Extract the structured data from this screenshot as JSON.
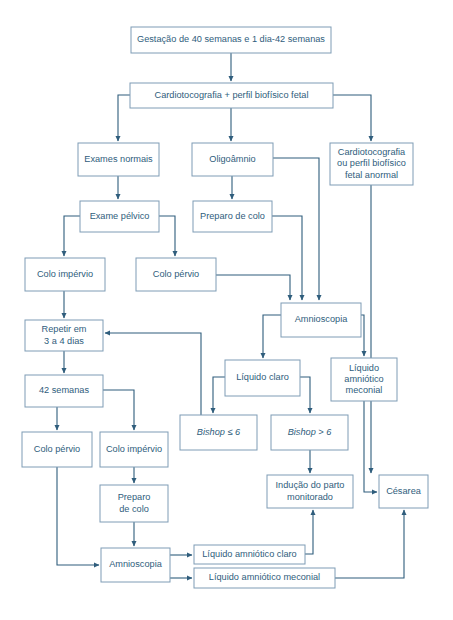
{
  "diagram": {
    "colors": {
      "box_stroke": "#7e9cb5",
      "box_fill": "#ffffff",
      "text": "#2f5d7c",
      "edge": "#2f5d7c",
      "background": "#ffffff"
    },
    "nodes": [
      {
        "id": "n1",
        "label": "Gestação de 40 semanas e 1 dia-42 semanas",
        "x": 131,
        "y": 27,
        "w": 200,
        "h": 26,
        "lines": [
          "Gestação de 40 semanas e 1 dia-42 semanas"
        ],
        "italic": false
      },
      {
        "id": "n2",
        "label": "Cardiotocografia + perfil biofísico fetal",
        "x": 130,
        "y": 83,
        "w": 203,
        "h": 25,
        "lines": [
          "Cardiotocografia + perfil biofísico fetal"
        ],
        "italic": false
      },
      {
        "id": "n3",
        "label": "Exames normais",
        "x": 78,
        "y": 143,
        "w": 81,
        "h": 33,
        "lines": [
          "Exames normais"
        ],
        "italic": false
      },
      {
        "id": "n4",
        "label": "Oligoâmnio",
        "x": 192,
        "y": 143,
        "w": 81,
        "h": 33,
        "lines": [
          "Oligoâmnio"
        ],
        "italic": false
      },
      {
        "id": "n5",
        "label": "Cardiotocografia ou perfil biofísico fetal anormal",
        "x": 330,
        "y": 143,
        "w": 83,
        "h": 42,
        "lines": [
          "Cardiotocografia",
          "ou perfil biofísico",
          "fetal anormal"
        ],
        "italic": false
      },
      {
        "id": "n6",
        "label": "Exame pélvico",
        "x": 80,
        "y": 201,
        "w": 79,
        "h": 31,
        "lines": [
          "Exame pélvico"
        ],
        "italic": false
      },
      {
        "id": "n7",
        "label": "Preparo de colo",
        "x": 193,
        "y": 201,
        "w": 79,
        "h": 31,
        "lines": [
          "Preparo de colo"
        ],
        "italic": false
      },
      {
        "id": "n8",
        "label": "Colo impérvio",
        "x": 25,
        "y": 258,
        "w": 80,
        "h": 33,
        "lines": [
          "Colo impérvio"
        ],
        "italic": false
      },
      {
        "id": "n9",
        "label": "Colo pérvio",
        "x": 136,
        "y": 258,
        "w": 80,
        "h": 33,
        "lines": [
          "Colo pérvio"
        ],
        "italic": false
      },
      {
        "id": "n10",
        "label": "Amnioscopia",
        "x": 281,
        "y": 303,
        "w": 80,
        "h": 34,
        "lines": [
          "Amnioscopia"
        ],
        "italic": false
      },
      {
        "id": "n11",
        "label": "Repetir em 3 a 4 dias",
        "x": 25,
        "y": 320,
        "w": 78,
        "h": 31,
        "lines": [
          "Repetir em",
          "3 a 4 dias"
        ],
        "italic": false
      },
      {
        "id": "n12",
        "label": "Líquido claro",
        "x": 225,
        "y": 360,
        "w": 75,
        "h": 36,
        "lines": [
          "Líquido claro"
        ],
        "italic": false
      },
      {
        "id": "n13",
        "label": "Líquido amniótico meconial",
        "x": 331,
        "y": 358,
        "w": 66,
        "h": 43,
        "lines": [
          "Líquido",
          "amniótico",
          "meconial"
        ],
        "italic": false
      },
      {
        "id": "n14",
        "label": "42 semanas",
        "x": 25,
        "y": 375,
        "w": 78,
        "h": 32,
        "lines": [
          "42 semanas"
        ],
        "italic": false
      },
      {
        "id": "n15",
        "label": "Bishop ≤ 6",
        "x": 180,
        "y": 415,
        "w": 77,
        "h": 35,
        "lines": [
          "Bishop ≤ 6"
        ],
        "italic": true
      },
      {
        "id": "n16",
        "label": "Bishop > 6",
        "x": 271,
        "y": 415,
        "w": 77,
        "h": 35,
        "lines": [
          "Bishop > 6"
        ],
        "italic": true
      },
      {
        "id": "n17",
        "label": "Colo pérvio",
        "x": 22,
        "y": 432,
        "w": 70,
        "h": 35,
        "lines": [
          "Colo pérvio"
        ],
        "italic": false
      },
      {
        "id": "n18",
        "label": "Colo impérvio",
        "x": 100,
        "y": 432,
        "w": 68,
        "h": 35,
        "lines": [
          "Colo impérvio"
        ],
        "italic": false
      },
      {
        "id": "n19",
        "label": "Indução do parto monitorado",
        "x": 267,
        "y": 475,
        "w": 86,
        "h": 33,
        "lines": [
          "Indução do parto",
          "monitorado"
        ],
        "italic": false
      },
      {
        "id": "n20",
        "label": "Césarea",
        "x": 379,
        "y": 475,
        "w": 49,
        "h": 33,
        "lines": [
          "Césarea"
        ],
        "italic": false
      },
      {
        "id": "n21",
        "label": "Preparo de colo",
        "x": 100,
        "y": 485,
        "w": 68,
        "h": 37,
        "lines": [
          "Preparo",
          "de colo"
        ],
        "italic": false
      },
      {
        "id": "n22",
        "label": "Amnioscopia",
        "x": 101,
        "y": 548,
        "w": 69,
        "h": 34,
        "lines": [
          "Amnioscopia"
        ],
        "italic": false
      },
      {
        "id": "n23",
        "label": "Líquido amniótico claro",
        "x": 194,
        "y": 545,
        "w": 111,
        "h": 19,
        "lines": [
          "Líquido amniótico claro"
        ],
        "italic": false
      },
      {
        "id": "n24",
        "label": "Líquido amniótico meconial",
        "x": 194,
        "y": 568,
        "w": 141,
        "h": 20,
        "lines": [
          "Líquido amniótico meconial"
        ],
        "italic": false
      }
    ],
    "edges": [
      {
        "from": "n1",
        "to": "n2",
        "path": "M231,53 L231,81",
        "arrow": true
      },
      {
        "from": "n2",
        "to": "n3",
        "path": "M130,95 L118,95 L118,141",
        "arrow": true
      },
      {
        "from": "n2",
        "to": "n4",
        "path": "M231,108 L231,141",
        "arrow": true
      },
      {
        "from": "n2",
        "to": "n5",
        "path": "M333,95 L371,95 L371,141",
        "arrow": true
      },
      {
        "from": "n3",
        "to": "n6",
        "path": "M118,176 L118,199",
        "arrow": true
      },
      {
        "from": "n4",
        "to": "n7",
        "path": "M232,176 L232,199",
        "arrow": true
      },
      {
        "from": "n4",
        "to": "n10",
        "path": "M273,158 L319,158 L319,300",
        "arrow": true
      },
      {
        "from": "n6",
        "to": "n8",
        "path": "M80,216 L64,216 L64,256",
        "arrow": true
      },
      {
        "from": "n6",
        "to": "n9",
        "path": "M159,216 L175,216 L175,256",
        "arrow": true
      },
      {
        "from": "n7",
        "to": "n10",
        "path": "M272,216 L302,216 L302,300",
        "arrow": true
      },
      {
        "from": "n9",
        "to": "n10",
        "path": "M216,275 L290,275 L290,300",
        "arrow": true
      },
      {
        "from": "n8",
        "to": "n11",
        "path": "M64,291 L64,318",
        "arrow": true
      },
      {
        "from": "n5",
        "to": "n20",
        "path": "M371,185 L371,473",
        "arrow": true
      },
      {
        "from": "n10",
        "to": "n12",
        "path": "M281,315 L263,315 L263,358",
        "arrow": true
      },
      {
        "from": "n10",
        "to": "n13",
        "path": "M361,315 L364,315 L364,356",
        "arrow": true
      },
      {
        "from": "n11",
        "to": "n14",
        "path": "M64,351 L64,373",
        "arrow": true
      },
      {
        "from": "n12",
        "to": "n15",
        "path": "M225,377 L213,377 L213,413",
        "arrow": true
      },
      {
        "from": "n12",
        "to": "n16",
        "path": "M300,377 L310,377 L310,413",
        "arrow": true
      },
      {
        "from": "n15",
        "to": "n11",
        "path": "M201,415 L201,333 L105,333",
        "arrow": true
      },
      {
        "from": "n14",
        "to": "n17",
        "path": "M57,407 L57,430",
        "arrow": true
      },
      {
        "from": "n14",
        "to": "n18",
        "path": "M103,390 L134,390 L134,430",
        "arrow": true
      },
      {
        "from": "n16",
        "to": "n19",
        "path": "M310,450 L310,473",
        "arrow": true
      },
      {
        "from": "n13",
        "to": "n20",
        "path": "M364,401 L364,492 L377,492",
        "arrow": true
      },
      {
        "from": "n18",
        "to": "n21",
        "path": "M134,467 L134,483",
        "arrow": true
      },
      {
        "from": "n21",
        "to": "n22",
        "path": "M134,522 L134,546",
        "arrow": true
      },
      {
        "from": "n17",
        "to": "n22",
        "path": "M57,467 L57,565 L99,565",
        "arrow": true
      },
      {
        "from": "n22",
        "to": "n23",
        "path": "M170,555 L192,555",
        "arrow": true
      },
      {
        "from": "n22",
        "to": "n24",
        "path": "M170,578 L192,578",
        "arrow": true
      },
      {
        "from": "n23",
        "to": "n19",
        "path": "M305,554 L313,554 L313,510",
        "arrow": true
      },
      {
        "from": "n24",
        "to": "n20",
        "path": "M335,578 L404,578 L404,510",
        "arrow": true
      }
    ]
  }
}
